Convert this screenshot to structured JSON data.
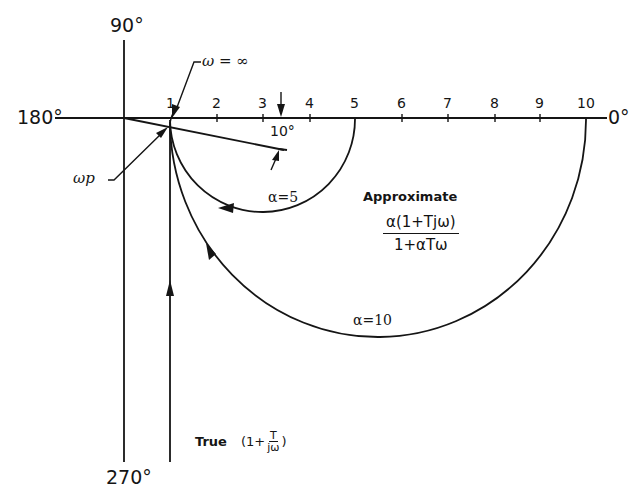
{
  "diagram": {
    "type": "polar-plot (Nyquist-style) comparison of true vs approximate frequency response",
    "axes": {
      "angle_labels": {
        "top": "90°",
        "left": "180°",
        "right": "0°",
        "bottom": "270°"
      },
      "real_axis_ticks": [
        "1",
        "2",
        "3",
        "4",
        "5",
        "6",
        "7",
        "8",
        "9",
        "10"
      ]
    },
    "annotations": {
      "omega_infinity": "ω = ∞",
      "omega_p": "ωp",
      "ten_degrees": "10°",
      "alpha_5": "α=5",
      "alpha_10": "α=10"
    },
    "legend": {
      "approximate_title": "Approximate",
      "approximate_numerator": "α(1+Tjω)",
      "approximate_denominator": "1+αTω",
      "true_label": "True",
      "true_expr_prefix": "(1+",
      "true_expr_num": "T",
      "true_expr_den": "jω",
      "true_expr_suffix": ")"
    },
    "curves": [
      {
        "name": "True (1 + T/jω)",
        "shape": "vertical line at Re=1 from -j∞ up to the real axis",
        "direction": "upward"
      },
      {
        "name": "Approximate α=5",
        "shape": "semicircle below real axis from Re=1 to Re=5",
        "direction": "from 5 toward 1"
      },
      {
        "name": "Approximate α=10",
        "shape": "semicircle below real axis from Re=1 to Re=10",
        "direction": "from 10 toward 1"
      },
      {
        "name": "10° line",
        "shape": "ray from origin at -10° through the point near Re=1"
      }
    ],
    "colors": {
      "ink": "#151515",
      "background": "#ffffff"
    }
  }
}
